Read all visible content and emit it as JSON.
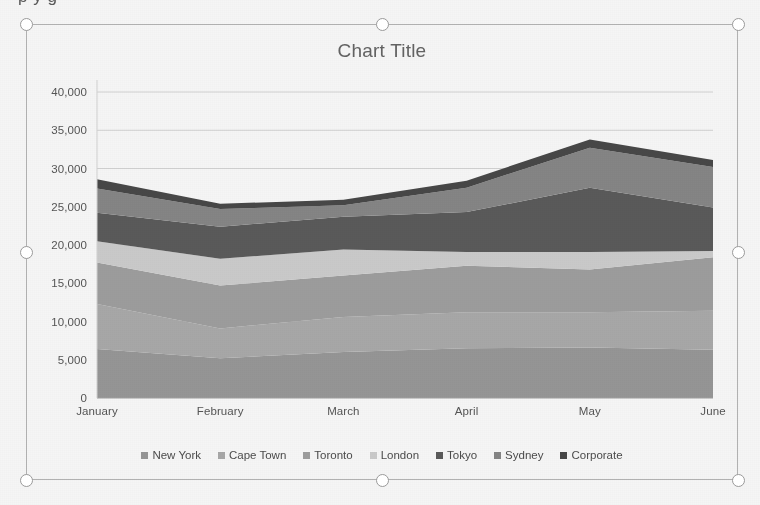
{
  "overflow_text": "p y g",
  "chart": {
    "title": "Chart Title"
  },
  "selection": {
    "handles": [
      "top-left",
      "top-center",
      "top-right",
      "middle-left",
      "middle-right",
      "bottom-left",
      "bottom-center",
      "bottom-right"
    ]
  },
  "colors": {
    "new_york": "#9b9b9b",
    "cape_town": "#aeaeae",
    "toronto": "#a3a3a3",
    "london": "#d2d2d2",
    "tokyo": "#5d5d5d",
    "sydney": "#8a8a8a",
    "corporate": "#4a4a4a",
    "axis": "#a6a6a6",
    "gridline": "#d9d9d9",
    "text": "#585858",
    "title_text": "#676767",
    "frame": "#b9b9b9",
    "handle_stroke": "#9a9a9a"
  },
  "chart_data": {
    "type": "area",
    "title": "Chart Title",
    "xlabel": "",
    "ylabel": "",
    "stacked": true,
    "grid": true,
    "legend_position": "bottom",
    "ylim": [
      0,
      40000
    ],
    "yticks": [
      0,
      5000,
      10000,
      15000,
      20000,
      25000,
      30000,
      35000,
      40000
    ],
    "ytick_labels": [
      "0",
      "5,000",
      "10,000",
      "15,000",
      "20,000",
      "25,000",
      "30,000",
      "35,000",
      "40,000"
    ],
    "categories": [
      "January",
      "February",
      "March",
      "April",
      "May",
      "June"
    ],
    "series": [
      {
        "name": "New York",
        "values": [
          6400,
          5200,
          6000,
          6500,
          6600,
          6300
        ]
      },
      {
        "name": "Cape Town",
        "values": [
          5900,
          3900,
          4600,
          4700,
          4600,
          5100
        ]
      },
      {
        "name": "Toronto",
        "values": [
          5400,
          5600,
          5400,
          6100,
          5600,
          7000
        ]
      },
      {
        "name": "London",
        "values": [
          2800,
          3500,
          3400,
          1800,
          2300,
          800
        ]
      },
      {
        "name": "Tokyo",
        "values": [
          3700,
          4200,
          4300,
          5200,
          8400,
          5700
        ]
      },
      {
        "name": "Sydney",
        "values": [
          3200,
          2300,
          1500,
          3200,
          5200,
          5300
        ]
      },
      {
        "name": "Corporate",
        "values": [
          1200,
          700,
          700,
          900,
          1100,
          900
        ]
      }
    ],
    "totals": [
      28600,
      25400,
      25900,
      28400,
      33800,
      31100
    ]
  }
}
